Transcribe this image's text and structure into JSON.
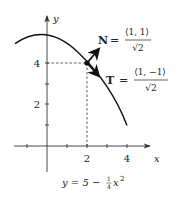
{
  "diagram": {
    "axes": {
      "x_label": "x",
      "y_label": "y",
      "x_ticks": [
        {
          "value": -1,
          "label": ""
        },
        {
          "value": 1,
          "label": ""
        },
        {
          "value": 2,
          "label": "2"
        },
        {
          "value": 3,
          "label": ""
        },
        {
          "value": 4,
          "label": "4"
        }
      ],
      "y_ticks": [
        {
          "value": 1,
          "label": ""
        },
        {
          "value": 2,
          "label": "2"
        },
        {
          "value": 3,
          "label": ""
        },
        {
          "value": 4,
          "label": "4"
        }
      ]
    },
    "curve": {
      "equation_lhs": "y = 5 − ",
      "equation_frac_num": "1",
      "equation_frac_den": "4",
      "equation_rhs_var": "x",
      "equation_rhs_exp": "2",
      "domain": [
        -1.6,
        4
      ]
    },
    "point": {
      "x": 2,
      "y": 4
    },
    "vectors": {
      "N": {
        "symbol": "N",
        "equals": "=",
        "numerator": "⟨1, 1⟩",
        "denominator": "√2"
      },
      "T": {
        "symbol": "T",
        "equals": "=",
        "numerator": "⟨1, −1⟩",
        "denominator": "√2"
      }
    },
    "colors": {
      "ink": "#222222",
      "background": "#ffffff"
    }
  }
}
